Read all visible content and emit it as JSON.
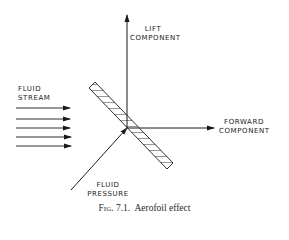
{
  "labels": {
    "lift": [
      "LIFT",
      "COMPONENT"
    ],
    "fluid_stream": [
      "FLUID",
      "STREAM"
    ],
    "forward": [
      "FORWARD",
      "COMPONENT"
    ],
    "fluid_pressure": [
      "FLUID",
      "PRESSURE"
    ]
  },
  "caption": {
    "fig": "Fig. 7.1.",
    "text": "Aerofoil effect"
  },
  "colors": {
    "ink": "#1a1a1a",
    "background": "#ffffff"
  }
}
